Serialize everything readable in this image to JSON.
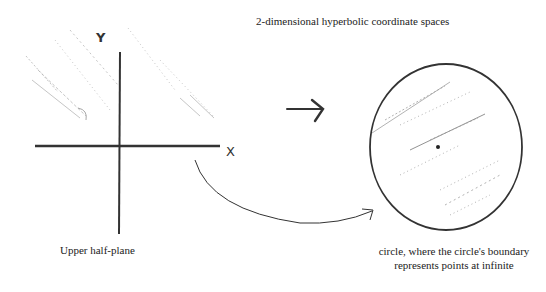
{
  "title": "2-dimensional hyperbolic coordinate spaces",
  "left_figure": {
    "caption": "Upper half-plane",
    "x_axis_label": "X",
    "y_axis_label": "Y"
  },
  "right_figure": {
    "caption_line1": "circle, where the circle's boundary",
    "caption_line2": "represents points at infinite"
  },
  "connectors": {
    "arrow_between": "right-arrow",
    "curved_arrow": "half-plane-to-circle"
  }
}
